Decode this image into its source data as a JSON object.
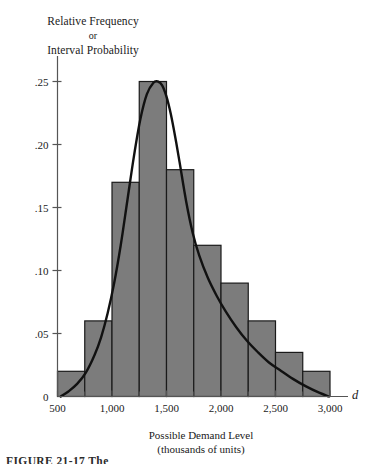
{
  "figure": {
    "caption": "FIGURE 21-17  The",
    "ylabel_line1": "Relative Frequency",
    "ylabel_line2": "or",
    "ylabel_line3": "Interval Probability",
    "xlabel_line1": "Possible Demand Level",
    "xlabel_line2": "(thousands of units)",
    "axis_variable": "d"
  },
  "colors": {
    "bar_fill": "#7c7c7c",
    "bar_stroke": "#1a1a1a",
    "curve": "#111111",
    "axis": "#555555",
    "text": "#1a1a1a"
  },
  "chart_data": {
    "type": "bar",
    "title": "",
    "subtitle": "",
    "xlabel": "Possible Demand Level (thousands of units)",
    "ylabel": "Relative Frequency or Interval Probability",
    "xlim": [
      500,
      3000
    ],
    "ylim": [
      0,
      0.265
    ],
    "grid": false,
    "legend_position": "none",
    "x_tick_labels": [
      "500",
      "1,000",
      "1,500",
      "2,000",
      "2,500",
      "3,000"
    ],
    "x_tick_values": [
      500,
      1000,
      1500,
      2000,
      2500,
      3000
    ],
    "x_minor_tick_values": [
      750,
      1250,
      1750,
      2250,
      2750
    ],
    "y_tick_labels": [
      "0",
      ".05",
      ".10",
      ".15",
      ".20",
      ".25"
    ],
    "y_tick_values": [
      0,
      0.05,
      0.1,
      0.15,
      0.2,
      0.25
    ],
    "bin_width": 250,
    "categories": [
      "500-750",
      "750-1,000",
      "1,000-1,250",
      "1,250-1,500",
      "1,500-1,750",
      "1,750-2,000",
      "2,000-2,250",
      "2,250-2,500",
      "2,500-2,750",
      "2,750-3,000"
    ],
    "bin_edges": [
      500,
      750,
      1000,
      1250,
      1500,
      1750,
      2000,
      2250,
      2500,
      2750,
      3000
    ],
    "values": [
      0.02,
      0.06,
      0.17,
      0.25,
      0.18,
      0.12,
      0.09,
      0.06,
      0.035,
      0.02
    ],
    "overlay_curve": {
      "name": "smooth density curve",
      "type": "line",
      "x": [
        530,
        600,
        680,
        760,
        840,
        900,
        960,
        1020,
        1080,
        1140,
        1200,
        1260,
        1320,
        1380,
        1420,
        1460,
        1500,
        1540,
        1580,
        1620,
        1680,
        1740,
        1800,
        1880,
        1960,
        2040,
        2140,
        2240,
        2340,
        2440,
        2540,
        2660,
        2780,
        2900,
        2990
      ],
      "y": [
        0.0,
        0.004,
        0.01,
        0.019,
        0.033,
        0.047,
        0.066,
        0.09,
        0.12,
        0.155,
        0.19,
        0.22,
        0.24,
        0.249,
        0.25,
        0.247,
        0.238,
        0.224,
        0.206,
        0.186,
        0.155,
        0.13,
        0.112,
        0.094,
        0.08,
        0.068,
        0.055,
        0.044,
        0.035,
        0.027,
        0.021,
        0.014,
        0.008,
        0.003,
        0.0
      ]
    }
  }
}
